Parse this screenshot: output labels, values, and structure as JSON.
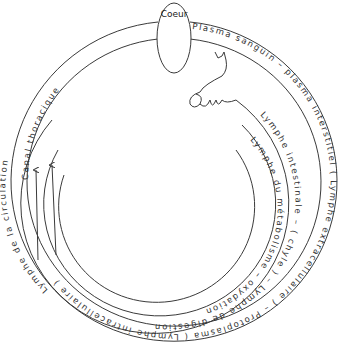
{
  "diagram": {
    "type": "circulation-cycle",
    "center_node": {
      "label": "Coeur"
    },
    "rings": [
      {
        "id": "outer",
        "labels": [
          "Plasma sanguin",
          "plasma interstitiel (Lymphe extracellulaire)",
          "Protoplasma (Lymphe intracellulaire)",
          "Lymphe de la circulation"
        ]
      },
      {
        "id": "ring-2",
        "labels": [
          "Lymphe intestinale",
          "(chyle)",
          "Lymphe de digestion"
        ]
      },
      {
        "id": "ring-3",
        "labels": [
          "Lymphe du métabolisme",
          "oxydation"
        ]
      },
      {
        "id": "upper-left",
        "labels": [
          "Canal thoracique"
        ]
      }
    ],
    "labels": {
      "coeur": "Coeur",
      "canal": "Canal thoracique",
      "plasma_sanguin": "Plasma sanguin   –   plasma interstitiel   ( Lymphe extracellulaire )   –   Protoplasma ( Lymphe intracellulaire )",
      "lymphe_circ": "Lymphe de la circulation",
      "lymphe_int": "Lymphe intestinale   –   ( chyle )   –   Lymphe de digestion",
      "lymphe_meta": "Lymphe du métabolisme   –   oxydation",
      "sep": "–"
    },
    "arrows": [
      {
        "direction": "up",
        "location": "left-inner-1"
      },
      {
        "direction": "up",
        "location": "left-inner-2"
      }
    ],
    "illustration": "intestine-coil"
  },
  "colors": {
    "line": "#3a3a3a",
    "text": "#333333",
    "background": "#ffffff"
  }
}
